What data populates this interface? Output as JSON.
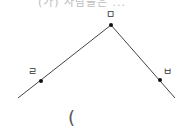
{
  "diagram": {
    "top_text_cut": "(가) 사람들은 ... ",
    "points": [
      {
        "id": "apex",
        "label": "ㅁ",
        "x": 111,
        "y": 25
      },
      {
        "id": "left",
        "label": "ㄹ",
        "x": 41,
        "y": 81
      },
      {
        "id": "right",
        "label": "ㅂ",
        "x": 160,
        "y": 80
      }
    ],
    "lines": [
      {
        "from": [
          18,
          98
        ],
        "to": [
          111,
          25
        ]
      },
      {
        "from": [
          111,
          25
        ],
        "to": [
          175,
          98
        ]
      }
    ],
    "answer_paren": "(",
    "colors": {
      "line": "#444444",
      "point": "#111111"
    }
  }
}
